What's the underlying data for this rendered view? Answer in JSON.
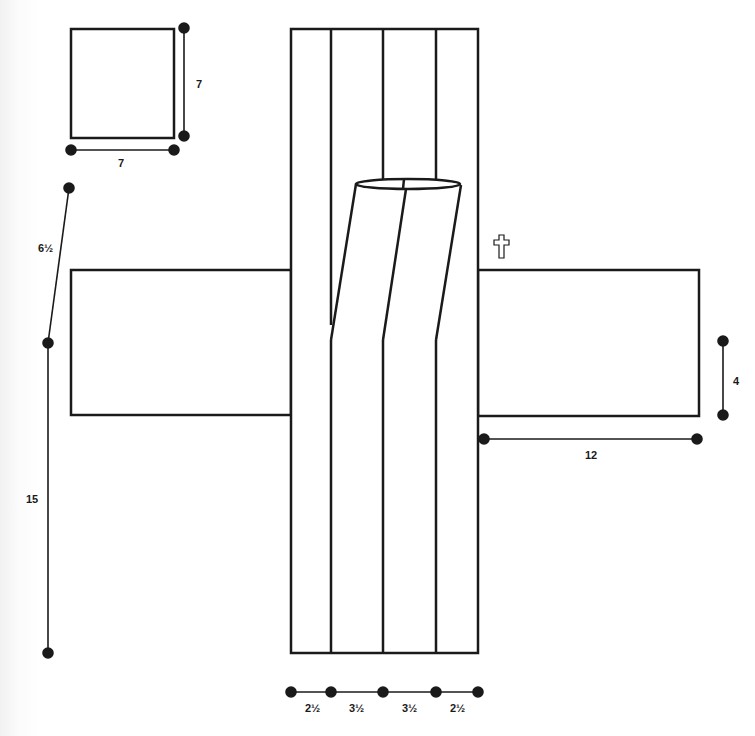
{
  "diagram": {
    "title": "",
    "stroke_color": "#1a1a1a",
    "background": "#ffffff",
    "shapes": {
      "square": {
        "label": "square-panel",
        "x": 71,
        "y": 29,
        "w": 103,
        "h": 109
      },
      "left_arm": {
        "label": "left-arm-panel",
        "x": 71,
        "y": 270,
        "w": 220,
        "h": 145
      },
      "right_arm": {
        "label": "right-arm-panel",
        "x": 478,
        "y": 270,
        "w": 221,
        "h": 146
      },
      "center_column": {
        "label": "center-column",
        "x": 291,
        "y": 29,
        "w": 187,
        "h": 624,
        "dividers_x": [
          331,
          383,
          436
        ]
      }
    },
    "symbols": {
      "cross": {
        "glyph": "✞",
        "name": "cross-symbol"
      }
    },
    "dimensions": [
      {
        "id": "square-height",
        "label": "7"
      },
      {
        "id": "square-width",
        "label": "7"
      },
      {
        "id": "slant-length",
        "label": "6½"
      },
      {
        "id": "left-vertical-length",
        "label": "15"
      },
      {
        "id": "right-arm-height",
        "label": "4"
      },
      {
        "id": "right-arm-width",
        "label": "12"
      },
      {
        "id": "column-seg-1",
        "label": "2½"
      },
      {
        "id": "column-seg-2",
        "label": "3½"
      },
      {
        "id": "column-seg-3",
        "label": "3½"
      },
      {
        "id": "column-seg-4",
        "label": "2½"
      }
    ]
  }
}
